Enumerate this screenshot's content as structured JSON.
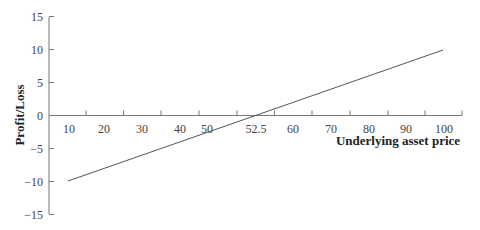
{
  "chart_data": {
    "type": "line",
    "title": "",
    "xlabel": "Underlying asset price",
    "ylabel": "Profit/Loss",
    "x_tick_labels": [
      "10",
      "20",
      "30",
      "40",
      "50",
      "52.5",
      "60",
      "70",
      "80",
      "90",
      "100"
    ],
    "y_ticks": [
      15,
      10,
      5,
      0,
      -5,
      -10,
      -15
    ],
    "y_tick_labels": [
      "15",
      "10",
      "5",
      "0",
      "−5",
      "−10",
      "−15"
    ],
    "ylim": [
      -15,
      15
    ],
    "xlim": [
      5,
      105
    ],
    "grid": false,
    "legend": null,
    "series": [
      {
        "name": "Payoff",
        "x": [
          10,
          52.5,
          100
        ],
        "y": [
          -10,
          0,
          10
        ]
      }
    ],
    "annotations": [
      {
        "text": "52.5",
        "meaning": "breakeven price"
      }
    ]
  },
  "colors": {
    "line": "#555555",
    "axis": "#777777",
    "text": "#333333"
  }
}
